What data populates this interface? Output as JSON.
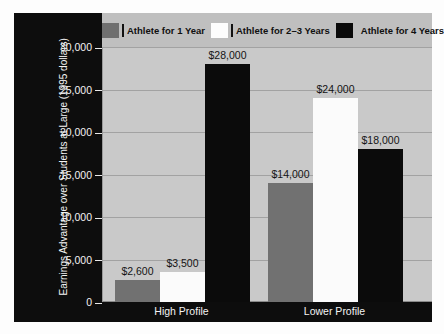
{
  "chart_data": {
    "type": "bar",
    "title": "",
    "xlabel": "",
    "ylabel": "Earnings Advantage over Students at Large (1995 dollars)",
    "categories": [
      "High Profile",
      "Lower Profile"
    ],
    "series": [
      {
        "name": "Athlete for 1 Year",
        "color": "#717171",
        "values": [
          2600,
          3500
        ]
      },
      {
        "name": "Athlete for 2–3 Years",
        "color": "#fbfbfb",
        "values": [
          3500,
          24000
        ]
      },
      {
        "name": "Athlete for 4 Years",
        "color": "#0b0b0b",
        "values": [
          28000,
          18000
        ]
      }
    ],
    "bars": [
      {
        "category": "High Profile",
        "series": "Athlete for 1 Year",
        "value": 2600,
        "label": "$2,600",
        "fill": "gray"
      },
      {
        "category": "High Profile",
        "series": "Athlete for 2–3 Years",
        "value": 3500,
        "label": "$3,500",
        "fill": "white"
      },
      {
        "category": "High Profile",
        "series": "Athlete for 4 Years",
        "value": 28000,
        "label": "$28,000",
        "fill": "black"
      },
      {
        "category": "Lower Profile",
        "series": "Athlete for 1 Year",
        "value": 14000,
        "label": "$14,000",
        "fill": "gray"
      },
      {
        "category": "Lower Profile",
        "series": "Athlete for 2–3 Years",
        "value": 24000,
        "label": "$24,000",
        "fill": "white"
      },
      {
        "category": "Lower Profile",
        "series": "Athlete for 4 Years",
        "value": 18000,
        "label": "$18,000",
        "fill": "black"
      }
    ],
    "ylim": [
      0,
      30000
    ],
    "ytick_values": [
      0,
      5000,
      10000,
      15000,
      20000,
      25000,
      30000
    ],
    "ytick_labels": [
      "0",
      "5,000",
      "10,000",
      "15,000",
      "20,000",
      "25,000",
      "30,000"
    ],
    "grid": true,
    "legend_position": "top"
  },
  "legend": {
    "items": [
      {
        "label": "Athlete for 1 Year",
        "swatch": "gray"
      },
      {
        "label": "Athlete for 2–3 Years",
        "swatch": "white"
      },
      {
        "label": "Athlete for 4 Years",
        "swatch": "black"
      }
    ]
  },
  "colors": {
    "frame": "#0d0d0d",
    "plot_background": "#c9c9c9",
    "legend_background": "#bfbfbf",
    "gridline": "#a2a2a2",
    "series_gray": "#717171",
    "series_white": "#fbfbfb",
    "series_black": "#0b0b0b",
    "axis_text": "#f2f2f2",
    "label_text": "#141414"
  }
}
